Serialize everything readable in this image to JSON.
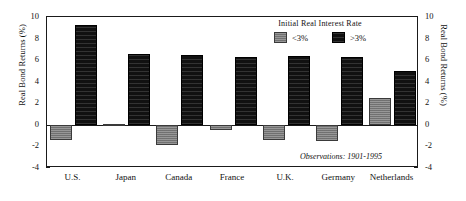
{
  "chart_data": {
    "type": "bar",
    "title": "",
    "xlabel": "",
    "ylabel": "Real Bond Returns (%)",
    "ylabel_right": "Real Bond Returns (%)",
    "ylim": [
      -4,
      10
    ],
    "yticks": [
      10,
      8,
      6,
      4,
      2,
      0,
      -2,
      -4
    ],
    "ytick_labels": [
      "10",
      "8",
      "6",
      "4",
      "2",
      "0",
      "-2",
      "-4"
    ],
    "grid": false,
    "categories": [
      "U.S.",
      "Japan",
      "Canada",
      "France",
      "U.K.",
      "Germany",
      "Netherlands"
    ],
    "series": [
      {
        "name": "<3%",
        "color": "#7d7d7d",
        "values": [
          -1.4,
          0.1,
          -1.9,
          -0.5,
          -1.4,
          -1.5,
          2.5
        ]
      },
      {
        "name": ">3%",
        "color": "#111111",
        "values": [
          9.3,
          6.6,
          6.5,
          6.3,
          6.4,
          6.3,
          5.0
        ]
      }
    ],
    "legend": {
      "title": "Initial Real Interest Rate",
      "position": "top-right",
      "entries": [
        "<3%",
        ">3%"
      ]
    },
    "annotations": [
      {
        "text": "Observations: 1901-1995",
        "position": "bottom-right"
      }
    ]
  },
  "legend": {
    "title": "Initial Real Interest Rate",
    "entries": [
      {
        "label": "<3%",
        "color": "#7d7d7d"
      },
      {
        "label": ">3%",
        "color": "#111111"
      }
    ]
  },
  "annotation": {
    "text": "Observations: 1901-1995"
  },
  "axes": {
    "y_title_left": "Real Bond Returns (%)",
    "y_title_right": "Real Bond Returns (%)"
  }
}
